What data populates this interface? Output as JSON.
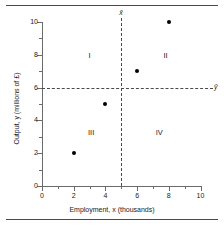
{
  "figure": {
    "has_top_rule": true,
    "has_bottom_rule": true,
    "background": "#ffffff",
    "frame_color": "#4a4a4a"
  },
  "chart_data": {
    "type": "scatter",
    "title": "",
    "xlabel": "Employment, x (thousands)",
    "ylabel": "Output, y (millions of £)",
    "xlim": [
      0,
      10
    ],
    "ylim": [
      0,
      10
    ],
    "grid": false,
    "legend": null,
    "x": [
      2,
      4,
      6,
      8
    ],
    "y": [
      2,
      5,
      7,
      10
    ],
    "points": [
      {
        "x": 2,
        "y": 2
      },
      {
        "x": 4,
        "y": 5
      },
      {
        "x": 6,
        "y": 7
      },
      {
        "x": 8,
        "y": 10
      }
    ],
    "point_color": "#000000",
    "xticks_major": [
      0,
      2,
      4,
      6,
      8,
      10
    ],
    "xticks_minor": [
      1,
      3,
      5,
      7,
      9
    ],
    "yticks_major": [
      0,
      2,
      4,
      6,
      8,
      10
    ],
    "yticks_minor": [
      1,
      3,
      5,
      7,
      9
    ],
    "xtick_labels": [
      "0",
      "2",
      "4",
      "6",
      "8",
      "10"
    ],
    "ytick_labels": [
      "0",
      "2",
      "4",
      "6",
      "8",
      "10"
    ],
    "reference_lines": [
      {
        "name": "x-mean",
        "orientation": "vertical",
        "value": 5,
        "label": "x̄",
        "style": "dashed",
        "color": "#4a4a4a"
      },
      {
        "name": "y-mean",
        "orientation": "horizontal",
        "value": 6,
        "label": "ȳ",
        "style": "dashed",
        "color": "#4a4a4a"
      }
    ],
    "annotations": [
      {
        "text": "I",
        "x": 3.0,
        "y": 8.0
      },
      {
        "text": "II",
        "x": 7.8,
        "y": 8.0
      },
      {
        "text": "III",
        "x": 3.1,
        "y": 3.3
      },
      {
        "text": "IV",
        "x": 7.4,
        "y": 3.3
      }
    ]
  },
  "axes": {
    "x_title": "Employment, x (thousands)",
    "y_title": "Output, y (millions of £)"
  }
}
